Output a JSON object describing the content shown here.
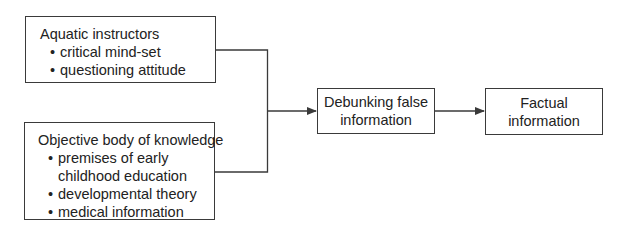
{
  "diagram": {
    "nodes": {
      "aquatic_instructors": {
        "title": "Aquatic instructors",
        "bullets": [
          "critical mind-set",
          "questioning attitude"
        ]
      },
      "objective_knowledge": {
        "title": "Objective body of knowledge",
        "bullets": [
          "premises of early childhood education",
          "developmental theory",
          "medical information"
        ],
        "bullet_lines": [
          "premises of early",
          "childhood education"
        ]
      },
      "debunking": {
        "line1": "Debunking false",
        "line2": "information"
      },
      "factual": {
        "line1": "Factual",
        "line2": "information"
      }
    },
    "edges": [
      {
        "from": "aquatic_instructors",
        "to": "debunking"
      },
      {
        "from": "objective_knowledge",
        "to": "debunking"
      },
      {
        "from": "debunking",
        "to": "factual"
      }
    ],
    "colors": {
      "line": "#3a3a3a",
      "text": "#222222",
      "background": "#ffffff"
    }
  }
}
